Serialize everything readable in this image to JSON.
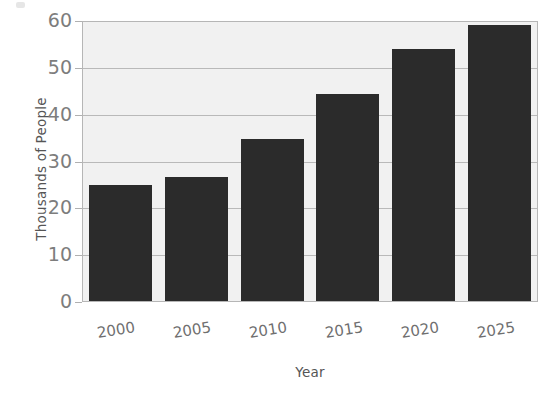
{
  "chart_data": {
    "type": "bar",
    "title": "",
    "subtitle": "",
    "xlabel": "Year",
    "ylabel": "Thousands of People",
    "categories": [
      "2000",
      "2005",
      "2010",
      "2015",
      "2020",
      "2025"
    ],
    "values": [
      25.0,
      26.6,
      34.8,
      44.5,
      54.3,
      59.3
    ],
    "series": [
      {
        "name": "Population",
        "values": [
          25.0,
          26.6,
          34.8,
          44.5,
          54.3,
          59.3
        ]
      }
    ],
    "ylim": [
      0,
      60
    ],
    "yticks": [
      0,
      10,
      20,
      30,
      40,
      50,
      60
    ],
    "ytick_labels": [
      "0",
      "10",
      "20",
      "30",
      "40",
      "50",
      "60"
    ],
    "xtick_labels": [
      "2000",
      "2005",
      "2010",
      "2015",
      "2020",
      "2025"
    ],
    "xtick_rotation": -9,
    "grid": "horizontal",
    "legend": "none",
    "bar_color": "#2b2b2b",
    "plot_background": "#f1f1f1",
    "gridline_color": "#b9b9b9",
    "axis_border_color": "#b6b6b6",
    "tick_label_color": "#7d7d7d",
    "axis_title_color": "#555555",
    "figure_background": "#ffffff",
    "annotations": []
  }
}
